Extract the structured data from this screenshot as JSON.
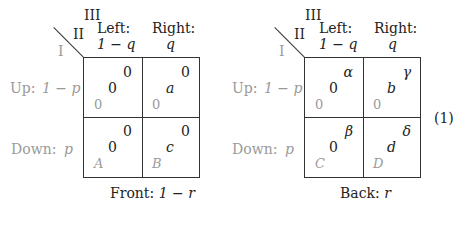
{
  "equation_number": "(1)",
  "players": {
    "player1": "I",
    "player2": "II",
    "player3": "III"
  },
  "columns": [
    {
      "label": "Left:",
      "prob": "1 − q"
    },
    {
      "label": "Right:",
      "prob": "q"
    }
  ],
  "rows": [
    {
      "label": "Up:",
      "prob": "1 − p"
    },
    {
      "label": "Down:",
      "prob": "p"
    }
  ],
  "matrices": [
    {
      "caption_label": "Front:",
      "caption_prob": "1 − r",
      "cells": [
        [
          {
            "p1": "0",
            "p2": "0",
            "p3": "0"
          },
          {
            "p1": "0",
            "p2": "a",
            "p3": "0"
          }
        ],
        [
          {
            "p1": "A",
            "p2": "0",
            "p3": "0"
          },
          {
            "p1": "B",
            "p2": "c",
            "p3": "0"
          }
        ]
      ]
    },
    {
      "caption_label": "Back:",
      "caption_prob": "r",
      "cells": [
        [
          {
            "p1": "0",
            "p2": "0",
            "p3": "α"
          },
          {
            "p1": "0",
            "p2": "b",
            "p3": "γ"
          }
        ],
        [
          {
            "p1": "C",
            "p2": "0",
            "p3": "β"
          },
          {
            "p1": "D",
            "p2": "d",
            "p3": "δ"
          }
        ]
      ]
    }
  ],
  "colors": {
    "line": "#333333",
    "player1_text": "#9a9a9a",
    "text": "#222222"
  }
}
